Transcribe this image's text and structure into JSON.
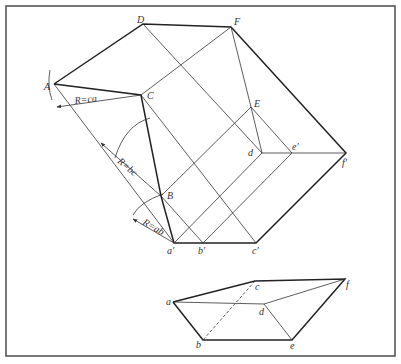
{
  "figure": {
    "colors": {
      "line": "#222222",
      "frame": "#555555",
      "background": "#ffffff"
    },
    "development": {
      "points": {
        "D": "D",
        "F": "F",
        "A": "A",
        "C": "C",
        "E": "E",
        "B": "B",
        "d": "d",
        "e_prime": "e′",
        "f_prime": "f′",
        "a_prime": "a′",
        "b_prime": "b′",
        "c_prime": "c′"
      },
      "radius_labels": {
        "ca": "R=ca",
        "bc": "R=bc",
        "ab": "R=ab"
      }
    },
    "pictorial": {
      "points": {
        "a": "a",
        "b": "b",
        "c": "c",
        "d": "d",
        "e": "e",
        "f": "f"
      }
    }
  }
}
